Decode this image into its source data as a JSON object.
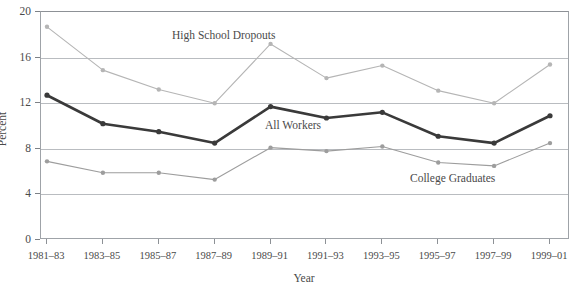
{
  "chart_data": {
    "type": "line",
    "title": "",
    "xlabel": "Year",
    "ylabel": "Percent",
    "categories": [
      "1981–83",
      "1983–85",
      "1985–87",
      "1987–89",
      "1989–91",
      "1991–93",
      "1993–95",
      "1995–97",
      "1997–99",
      "1999–01"
    ],
    "yticks": [
      0,
      4,
      8,
      12,
      16,
      20
    ],
    "ylim": [
      0,
      20
    ],
    "grid": true,
    "legend_position": "inline-annotations",
    "series": [
      {
        "name": "High School Dropouts",
        "color": "#b5b5b5",
        "values": [
          18.7,
          14.9,
          13.2,
          12.0,
          17.2,
          14.2,
          15.3,
          13.1,
          12.0,
          15.4
        ]
      },
      {
        "name": "All Workers",
        "color": "#3a3a3a",
        "values": [
          12.7,
          10.2,
          9.5,
          8.5,
          11.7,
          10.7,
          11.2,
          9.1,
          8.5,
          10.9
        ]
      },
      {
        "name": "College Graduates",
        "color": "#9d9d9d",
        "values": [
          6.9,
          5.9,
          5.9,
          5.3,
          8.1,
          7.8,
          8.2,
          6.8,
          6.5,
          8.5
        ]
      }
    ],
    "annotations": [
      {
        "text": "High School Dropouts",
        "x_px": 172,
        "y_px": 29
      },
      {
        "text": "All Workers",
        "x_px": 265,
        "y_px": 119
      },
      {
        "text": "College Graduates",
        "x_px": 410,
        "y_px": 172
      }
    ]
  }
}
